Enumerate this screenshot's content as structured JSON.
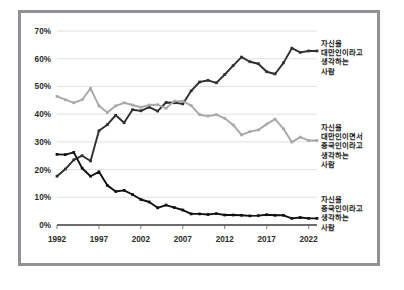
{
  "figure": {
    "frame_color": "#8f9194",
    "background": "#ffffff"
  },
  "legend": {
    "taiwanese": {
      "lines": [
        "자신을",
        "대만인이라고",
        "생각하는",
        "사람"
      ],
      "color": "#2f2f2f"
    },
    "both": {
      "lines": [
        "자신을",
        "대만인이면서",
        "중국인이라고",
        "생각하는",
        "사람"
      ],
      "color": "#a8a8a8"
    },
    "chinese": {
      "lines": [
        "자신을",
        "중국인이라고",
        "생각하는",
        "사람"
      ],
      "color": "#111111"
    }
  },
  "chart_data": {
    "type": "line",
    "title": "",
    "xlabel": "",
    "ylabel": "",
    "xlim": [
      1992,
      2023
    ],
    "ylim": [
      0,
      70
    ],
    "grid": true,
    "legend_position": "right",
    "ytick_labels": [
      "0%",
      "10%",
      "20%",
      "30%",
      "40%",
      "50%",
      "60%",
      "70%"
    ],
    "ytick_values": [
      0,
      10,
      20,
      30,
      40,
      50,
      60,
      70
    ],
    "xtick_labels": [
      "1992",
      "1997",
      "2002",
      "2007",
      "2012",
      "2017",
      "2022"
    ],
    "xtick_values": [
      1992,
      1997,
      2002,
      2007,
      2012,
      2017,
      2022
    ],
    "x": [
      1992,
      1993,
      1994,
      1995,
      1996,
      1997,
      1998,
      1999,
      2000,
      2001,
      2002,
      2003,
      2004,
      2005,
      2006,
      2007,
      2008,
      2009,
      2010,
      2011,
      2012,
      2013,
      2014,
      2015,
      2016,
      2017,
      2018,
      2019,
      2020,
      2021,
      2022,
      2023
    ],
    "series": [
      {
        "name": "자신을 대만인이라고 생각하는 사람",
        "color": "#2f2f2f",
        "values": [
          17.6,
          20.2,
          23.5,
          25.0,
          23.1,
          34.0,
          36.2,
          39.6,
          36.9,
          41.6,
          41.2,
          42.5,
          41.1,
          44.2,
          44.1,
          43.7,
          48.4,
          51.6,
          52.2,
          51.3,
          54.3,
          57.5,
          60.6,
          58.9,
          58.2,
          55.3,
          54.5,
          58.5,
          63.8,
          62.3,
          62.8,
          62.8
        ]
      },
      {
        "name": "자신을 대만인이면서 중국인이라고 생각하는 사람",
        "color": "#a8a8a8",
        "values": [
          46.4,
          45.2,
          44.1,
          45.2,
          49.3,
          43.0,
          40.6,
          43.0,
          44.1,
          43.3,
          42.5,
          43.3,
          43.4,
          42.1,
          44.7,
          44.7,
          43.1,
          39.8,
          39.3,
          39.8,
          38.5,
          36.1,
          32.5,
          33.7,
          34.3,
          36.4,
          38.2,
          34.7,
          29.9,
          31.7,
          30.5,
          30.5
        ]
      },
      {
        "name": "자신을 중국인이라고 생각하는 사람",
        "color": "#111111",
        "values": [
          25.5,
          25.4,
          26.2,
          20.5,
          17.6,
          19.2,
          14.3,
          12.1,
          12.5,
          11.0,
          9.2,
          8.3,
          6.2,
          7.2,
          6.3,
          5.4,
          4.0,
          4.0,
          3.8,
          4.1,
          3.6,
          3.6,
          3.5,
          3.3,
          3.4,
          3.7,
          3.5,
          3.5,
          2.4,
          2.7,
          2.4,
          2.4
        ]
      }
    ]
  }
}
